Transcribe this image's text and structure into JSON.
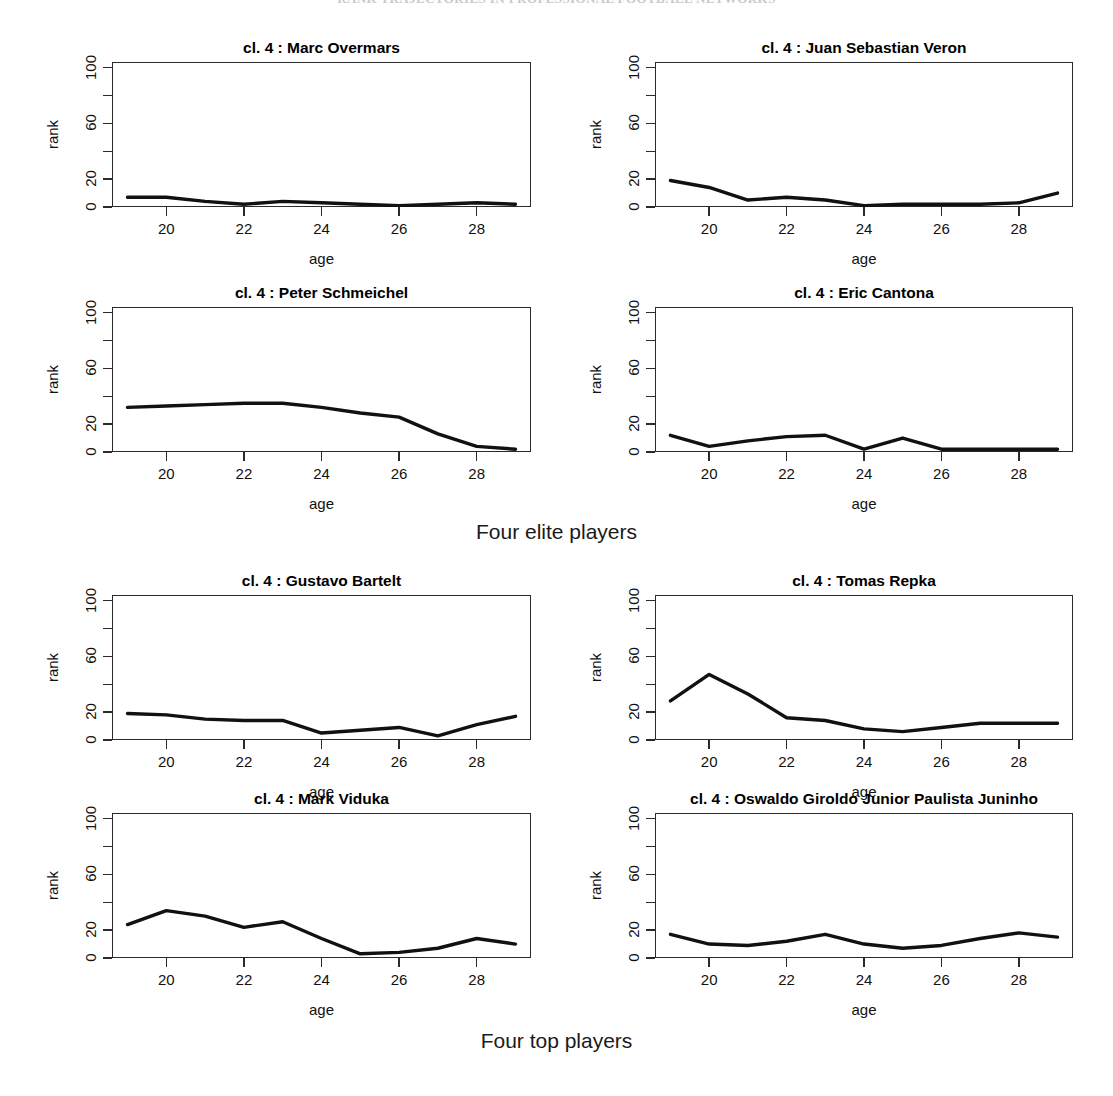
{
  "page_header": "RANK TRAJECTORIES IN PROFESSIONAL FOOTBALL NETWORKS",
  "figure": {
    "axis": {
      "xlabel": "age",
      "ylabel": "rank",
      "xticks": [
        20,
        22,
        24,
        26,
        28
      ],
      "xtick_labels": [
        "20",
        "22",
        "24",
        "26",
        "28"
      ],
      "yticks": [
        0,
        20,
        40,
        60,
        80,
        100
      ],
      "ytick_labels": [
        "0",
        "20",
        "",
        "60",
        "",
        "100"
      ],
      "xlim": [
        18.6,
        29.4
      ],
      "ylim": [
        0,
        104
      ]
    },
    "captions": {
      "elite": "Four elite players",
      "top": "Four top players"
    },
    "title_prefix": "cl. 4 : "
  },
  "chart_data": [
    {
      "type": "line",
      "group": "Four elite players",
      "position": "row1-left",
      "title": "cl. 4 :  Marc Overmars",
      "player": "Marc Overmars",
      "cluster": "cl. 4",
      "xlabel": "age",
      "ylabel": "rank",
      "xlim": [
        18.6,
        29.4
      ],
      "ylim": [
        0,
        104
      ],
      "grid": false,
      "legend": "none",
      "x": [
        19,
        20,
        21,
        22,
        23,
        24,
        25,
        26,
        27,
        28,
        29
      ],
      "values": [
        7,
        7,
        4,
        2,
        4,
        3,
        2,
        1,
        2,
        3,
        2
      ]
    },
    {
      "type": "line",
      "group": "Four elite players",
      "position": "row1-right",
      "title": "cl. 4 :  Juan Sebastian Veron",
      "player": "Juan Sebastian Veron",
      "cluster": "cl. 4",
      "xlabel": "age",
      "ylabel": "rank",
      "xlim": [
        18.6,
        29.4
      ],
      "ylim": [
        0,
        104
      ],
      "grid": false,
      "legend": "none",
      "x": [
        19,
        20,
        21,
        22,
        23,
        24,
        25,
        26,
        27,
        28,
        29
      ],
      "values": [
        19,
        14,
        5,
        7,
        5,
        1,
        2,
        2,
        2,
        3,
        10
      ]
    },
    {
      "type": "line",
      "group": "Four elite players",
      "position": "row2-left",
      "title": "cl. 4 :  Peter Schmeichel",
      "player": "Peter Schmeichel",
      "cluster": "cl. 4",
      "xlabel": "age",
      "ylabel": "rank",
      "xlim": [
        18.6,
        29.4
      ],
      "ylim": [
        0,
        104
      ],
      "grid": false,
      "legend": "none",
      "x": [
        19,
        20,
        21,
        22,
        23,
        24,
        25,
        26,
        27,
        28,
        29
      ],
      "values": [
        32,
        33,
        34,
        35,
        35,
        32,
        28,
        25,
        13,
        4,
        2
      ]
    },
    {
      "type": "line",
      "group": "Four elite players",
      "position": "row2-right",
      "title": "cl. 4 :  Eric Cantona",
      "player": "Eric Cantona",
      "cluster": "cl. 4",
      "xlabel": "age",
      "ylabel": "rank",
      "xlim": [
        18.6,
        29.4
      ],
      "ylim": [
        0,
        104
      ],
      "grid": false,
      "legend": "none",
      "x": [
        19,
        20,
        21,
        22,
        23,
        24,
        25,
        26,
        27,
        28,
        29
      ],
      "values": [
        12,
        4,
        8,
        11,
        12,
        2,
        10,
        2,
        2,
        2,
        2
      ]
    },
    {
      "type": "line",
      "group": "Four top players",
      "position": "row3-left",
      "title": "cl. 4 :  Gustavo Bartelt",
      "player": "Gustavo Bartelt",
      "cluster": "cl. 4",
      "xlabel": "age",
      "ylabel": "rank",
      "xlim": [
        18.6,
        29.4
      ],
      "ylim": [
        0,
        104
      ],
      "grid": false,
      "legend": "none",
      "x": [
        19,
        20,
        21,
        22,
        23,
        24,
        25,
        26,
        27,
        28,
        29
      ],
      "values": [
        19,
        18,
        15,
        14,
        14,
        5,
        7,
        9,
        3,
        11,
        17
      ]
    },
    {
      "type": "line",
      "group": "Four top players",
      "position": "row3-right",
      "title": "cl. 4 :  Tomas Repka",
      "player": "Tomas Repka",
      "cluster": "cl. 4",
      "xlabel": "age",
      "ylabel": "rank",
      "xlim": [
        18.6,
        29.4
      ],
      "ylim": [
        0,
        104
      ],
      "grid": false,
      "legend": "none",
      "x": [
        19,
        20,
        21,
        22,
        23,
        24,
        25,
        26,
        27,
        28,
        29
      ],
      "values": [
        28,
        47,
        33,
        16,
        14,
        8,
        6,
        9,
        12,
        12,
        12
      ]
    },
    {
      "type": "line",
      "group": "Four top players",
      "position": "row4-left",
      "title": "cl. 4 :  Mark Viduka",
      "player": "Mark Viduka",
      "cluster": "cl. 4",
      "xlabel": "age",
      "ylabel": "rank",
      "xlim": [
        18.6,
        29.4
      ],
      "ylim": [
        0,
        104
      ],
      "grid": false,
      "legend": "none",
      "x": [
        19,
        20,
        21,
        22,
        23,
        24,
        25,
        26,
        27,
        28,
        29
      ],
      "values": [
        24,
        34,
        30,
        22,
        26,
        14,
        3,
        4,
        7,
        14,
        10
      ]
    },
    {
      "type": "line",
      "group": "Four top players",
      "position": "row4-right",
      "title": "cl. 4 :  Oswaldo Giroldo Junior Paulista Juninho",
      "player": "Oswaldo Giroldo Junior Paulista Juninho",
      "cluster": "cl. 4",
      "xlabel": "age",
      "ylabel": "rank",
      "xlim": [
        18.6,
        29.4
      ],
      "ylim": [
        0,
        104
      ],
      "grid": false,
      "legend": "none",
      "x": [
        19,
        20,
        21,
        22,
        23,
        24,
        25,
        26,
        27,
        28,
        29
      ],
      "values": [
        17,
        10,
        9,
        12,
        17,
        10,
        7,
        9,
        14,
        18,
        15
      ]
    }
  ]
}
